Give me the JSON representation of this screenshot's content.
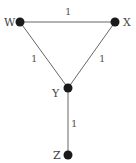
{
  "graph": {
    "nodes": [
      {
        "id": "W",
        "label": "W",
        "x": 20,
        "y": 22
      },
      {
        "id": "X",
        "label": "X",
        "x": 115,
        "y": 22
      },
      {
        "id": "Y",
        "label": "Y",
        "x": 68,
        "y": 88
      },
      {
        "id": "Z",
        "label": "Z",
        "x": 68,
        "y": 155
      }
    ],
    "edges": [
      {
        "from": "W",
        "to": "X",
        "weight": "1"
      },
      {
        "from": "W",
        "to": "Y",
        "weight": "1"
      },
      {
        "from": "X",
        "to": "Y",
        "weight": "1"
      },
      {
        "from": "Y",
        "to": "Z",
        "weight": "1"
      }
    ]
  }
}
